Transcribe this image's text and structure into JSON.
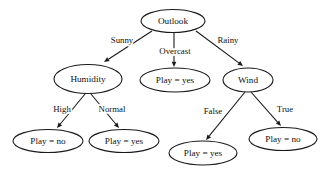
{
  "diagram": {
    "type": "decision-tree",
    "background_color": "#ffffff",
    "stroke_color": "#1a1a1a",
    "text_color": "#101010",
    "node_shape": "ellipse"
  },
  "nodes": [
    {
      "id": "outlook",
      "label": "Outlook",
      "kind": "root-attribute",
      "cx": 173,
      "cy": 21,
      "rx": 32,
      "ry": 11.5
    },
    {
      "id": "humidity",
      "label": "Humidity",
      "kind": "internal-attribute",
      "cx": 88,
      "cy": 79,
      "rx": 34,
      "ry": 14.5
    },
    {
      "id": "overcast_leaf",
      "label": "Play = yes",
      "kind": "leaf",
      "cx": 175,
      "cy": 80,
      "rx": 35,
      "ry": 12
    },
    {
      "id": "wind",
      "label": "Wind",
      "kind": "internal-attribute",
      "cx": 248,
      "cy": 80,
      "rx": 25,
      "ry": 12
    },
    {
      "id": "high_leaf",
      "label": "Play = no",
      "kind": "leaf",
      "cx": 48,
      "cy": 141,
      "rx": 35,
      "ry": 11.5
    },
    {
      "id": "normal_leaf",
      "label": "Play = yes",
      "kind": "leaf",
      "cx": 124,
      "cy": 141,
      "rx": 35,
      "ry": 11.5
    },
    {
      "id": "false_leaf",
      "label": "Play = yes",
      "kind": "leaf",
      "cx": 203,
      "cy": 153,
      "rx": 34,
      "ry": 12
    },
    {
      "id": "true_leaf",
      "label": "Play = no",
      "kind": "leaf",
      "cx": 283,
      "cy": 139,
      "rx": 34,
      "ry": 11.5
    }
  ],
  "edges": [
    {
      "id": "outlook-sunny",
      "from": "outlook",
      "to": "humidity",
      "label": "Sunny",
      "label_x": 122,
      "label_y": 41,
      "x1": 152,
      "y1": 31,
      "x2": 104,
      "y2": 62
    },
    {
      "id": "outlook-overcast",
      "from": "outlook",
      "to": "overcast_leaf",
      "label": "Overcast",
      "label_x": 175,
      "label_y": 52,
      "x1": 174,
      "y1": 33,
      "x2": 174,
      "y2": 67
    },
    {
      "id": "outlook-rainy",
      "from": "outlook",
      "to": "wind",
      "label": "Rainy",
      "label_x": 228,
      "label_y": 41,
      "x1": 196,
      "y1": 31,
      "x2": 243,
      "y2": 66
    },
    {
      "id": "humidity-high",
      "from": "humidity",
      "to": "high_leaf",
      "label": "High",
      "label_x": 62,
      "label_y": 110,
      "x1": 85,
      "y1": 94,
      "x2": 57,
      "y2": 128
    },
    {
      "id": "humidity-normal",
      "from": "humidity",
      "to": "normal_leaf",
      "label": "Normal",
      "label_x": 112,
      "label_y": 110,
      "x1": 91,
      "y1": 94,
      "x2": 119,
      "y2": 128
    },
    {
      "id": "wind-false",
      "from": "wind",
      "to": "false_leaf",
      "label": "False",
      "label_x": 213,
      "label_y": 112,
      "x1": 245,
      "y1": 92,
      "x2": 206,
      "y2": 140
    },
    {
      "id": "wind-true",
      "from": "wind",
      "to": "true_leaf",
      "label": "True",
      "label_x": 285,
      "label_y": 110,
      "x1": 251,
      "y1": 92,
      "x2": 281,
      "y2": 126
    }
  ]
}
